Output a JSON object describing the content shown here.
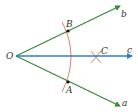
{
  "diagram": {
    "colors": {
      "ray_green": "#3a8a3a",
      "ray_blue": "#2f7fc4",
      "arc_red": "#d9826a",
      "point": "#111111",
      "label": "#333333"
    },
    "vertex": {
      "label": "O",
      "x": 16,
      "y": 56
    },
    "rays": [
      {
        "name": "b",
        "label": "b",
        "color": "green",
        "from": [
          16,
          56
        ],
        "to": [
          120,
          6
        ],
        "label_pos": [
          121,
          17
        ]
      },
      {
        "name": "a",
        "label": "a",
        "color": "green",
        "from": [
          16,
          56
        ],
        "to": [
          120,
          106
        ],
        "label_pos": [
          122,
          106
        ]
      },
      {
        "name": "c",
        "label": "c",
        "color": "blue",
        "from": [
          16,
          56
        ],
        "to": [
          132,
          56
        ],
        "label_pos": [
          127,
          53
        ]
      }
    ],
    "points": [
      {
        "label": "B",
        "x": 68,
        "y": 31,
        "label_pos": [
          66,
          27
        ]
      },
      {
        "label": "A",
        "x": 68,
        "y": 82,
        "label_pos": [
          66,
          93
        ]
      },
      {
        "label": "C",
        "x": 96,
        "y": 57,
        "label_pos": [
          101,
          54
        ],
        "mark": "cross"
      }
    ],
    "arc": {
      "start": [
        62,
        22
      ],
      "control": [
        80,
        56
      ],
      "end": [
        62,
        92
      ]
    }
  }
}
